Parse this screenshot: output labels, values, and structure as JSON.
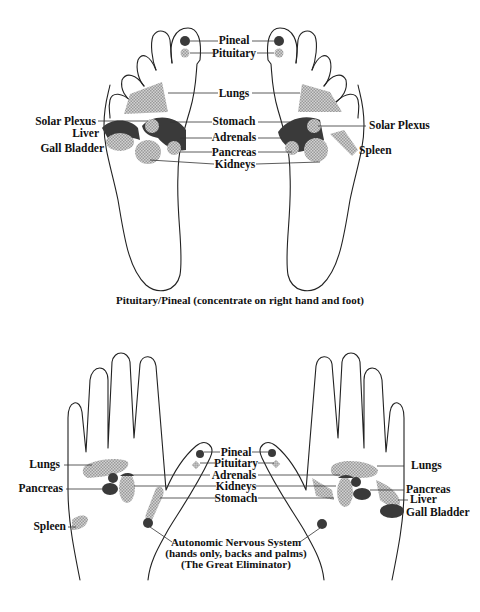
{
  "feet": {
    "caption": "Pituitary/Pineal (concentrate on right hand and foot)",
    "center_labels": {
      "pineal": "Pineal",
      "pituitary": "Pituitary",
      "lungs": "Lungs",
      "stomach": "Stomach",
      "adrenals": "Adrenals",
      "pancreas": "Pancreas",
      "kidneys": "Kidneys"
    },
    "left_labels": {
      "solar_plexus": "Solar Plexus",
      "liver": "Liver",
      "gall_bladder": "Gall Bladder"
    },
    "right_labels": {
      "solar_plexus": "Solar Plexus",
      "spleen": "Spleen"
    }
  },
  "hands": {
    "center_labels": {
      "pineal": "Pineal",
      "pituitary": "Pituitary",
      "adrenals": "Adrenals",
      "kidneys": "Kidneys",
      "stomach": "Stomach"
    },
    "left_labels": {
      "lungs": "Lungs",
      "pancreas": "Pancreas",
      "spleen": "Spleen"
    },
    "right_labels": {
      "lungs": "Lungs",
      "pancreas": "Pancreas",
      "liver": "Liver",
      "gall_bladder": "Gall Bladder"
    },
    "caption_lines": [
      "Autonomic Nervous System",
      "(hands only, backs and palms)",
      "(The Great Eliminator)"
    ]
  },
  "colors": {
    "outline": "#222222",
    "dark_zone": "#3a3a3a",
    "light_zone": "#b8b8b8",
    "background": "#ffffff"
  }
}
